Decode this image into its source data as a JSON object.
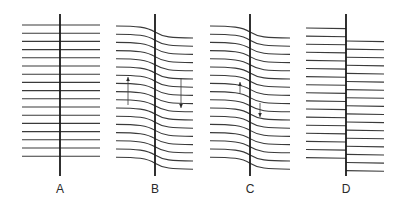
{
  "figure": {
    "panels": [
      {
        "id": "A",
        "label": "A",
        "type": "straight",
        "axis_x": 60,
        "left_x": 22,
        "right_x": 100,
        "line_count": 17,
        "first_y": 25,
        "spacing": 8.2,
        "offset": 0,
        "arrows": []
      },
      {
        "id": "B",
        "label": "B",
        "type": "curved",
        "axis_x": 155,
        "left_x": 116,
        "right_x": 193,
        "line_count": 17,
        "first_y": 26,
        "spacing": 8.2,
        "offset": 12,
        "arrows": [
          {
            "x": 128,
            "from_y": 105,
            "to_y": 77
          },
          {
            "x": 181,
            "from_y": 78,
            "to_y": 108
          }
        ]
      },
      {
        "id": "C",
        "label": "C",
        "type": "curved",
        "axis_x": 250,
        "left_x": 210,
        "right_x": 290,
        "line_count": 17,
        "first_y": 26,
        "spacing": 8.2,
        "offset": 12,
        "arrows": [
          {
            "x": 240,
            "from_y": 93,
            "to_y": 82
          },
          {
            "x": 260,
            "from_y": 103,
            "to_y": 117
          }
        ]
      },
      {
        "id": "D",
        "label": "D",
        "type": "stepped",
        "axis_x": 346,
        "left_x": 306,
        "right_x": 384,
        "line_count": 17,
        "first_y": 28,
        "spacing": 8.1,
        "offset": 13,
        "arrows": []
      }
    ],
    "axis_top": 14,
    "axis_bottom": 176,
    "label_y": 193,
    "colors": {
      "line": "#3a3a3a",
      "axis": "#1a1a1a",
      "background": "#ffffff"
    }
  }
}
